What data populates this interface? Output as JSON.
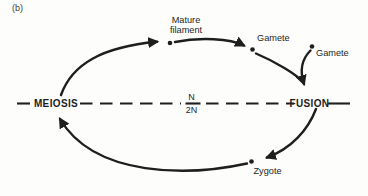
{
  "figure_label": "(b)",
  "colors": {
    "ink": "#1e1e1e",
    "figure_label_ink": "#3c3c3c",
    "background": "#fdfdfb"
  },
  "labels": {
    "mature_filament": "Mature\nfilament",
    "gamete_top": "Gamete",
    "gamete_right": "Gamete",
    "zygote": "Zygote",
    "meiosis": "MEIOSIS",
    "fusion": "FUSION"
  },
  "ploidy": {
    "numerator": "N",
    "denominator": "2N"
  }
}
